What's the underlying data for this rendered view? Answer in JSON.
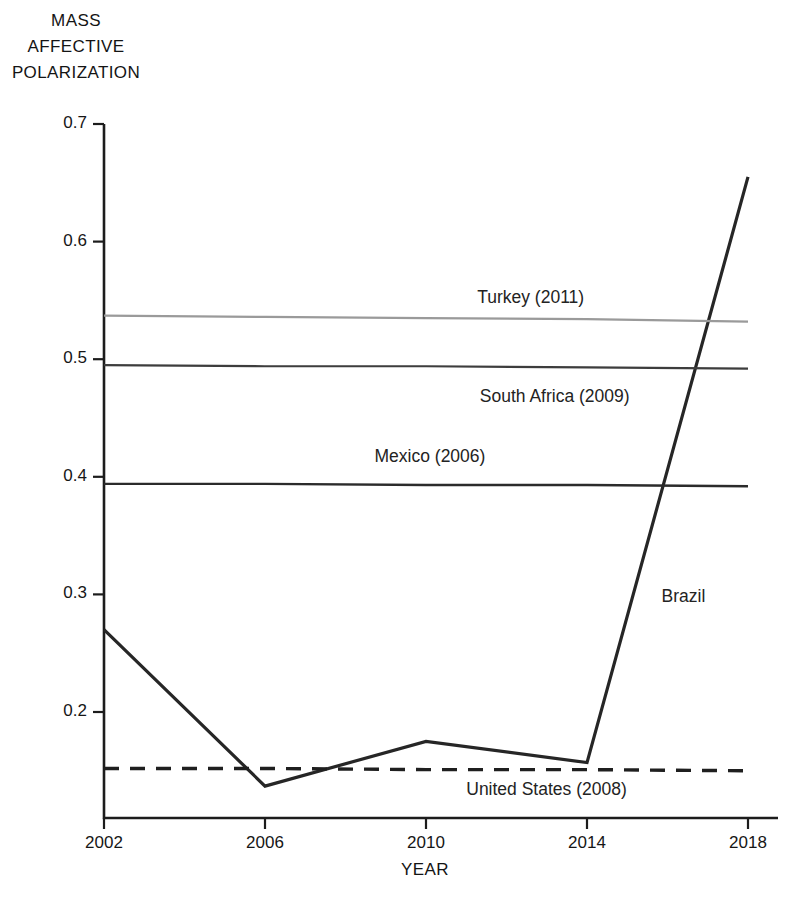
{
  "figure": {
    "background": "#ffffff",
    "axis_title_y_lines": [
      "MASS",
      "AFFECTIVE",
      "POLARIZATION"
    ],
    "axis_title_x": "YEAR"
  },
  "chart_data": {
    "type": "line",
    "title": "",
    "xlabel": "YEAR",
    "ylabel": "MASS AFFECTIVE POLARIZATION",
    "grid": false,
    "legend": "inline-labels",
    "xlim": [
      2002,
      2018
    ],
    "ylim": [
      0.135,
      0.72
    ],
    "x": [
      2002,
      2006,
      2010,
      2014,
      2018
    ],
    "xticks": [
      "2002",
      "2006",
      "2010",
      "2014",
      "2018"
    ],
    "yticks": [
      "0.2",
      "0.3",
      "0.4",
      "0.5",
      "0.6",
      "0.7"
    ],
    "ytick_values": [
      0.2,
      0.3,
      0.4,
      0.5,
      0.6,
      0.7
    ],
    "series": [
      {
        "name": "Brazil",
        "label": "Brazil",
        "style": "solid",
        "color": "#262626",
        "width": 3.2,
        "values": [
          0.27,
          0.137,
          0.175,
          0.157,
          0.655
        ]
      },
      {
        "name": "Turkey (2011)",
        "label": "Turkey (2011)",
        "style": "solid",
        "color": "#9a9a9a",
        "width": 2.2,
        "reference": true,
        "values": [
          0.537,
          0.536,
          0.535,
          0.534,
          0.532
        ]
      },
      {
        "name": "South Africa (2009)",
        "label": "South Africa (2009)",
        "style": "solid",
        "color": "#3d3d3d",
        "width": 2.2,
        "reference": true,
        "values": [
          0.495,
          0.494,
          0.494,
          0.493,
          0.492
        ]
      },
      {
        "name": "Mexico (2006)",
        "label": "Mexico (2006)",
        "style": "solid",
        "color": "#2b2b2b",
        "width": 2.4,
        "reference": true,
        "values": [
          0.394,
          0.394,
          0.393,
          0.393,
          0.392
        ]
      },
      {
        "name": "United States (2008)",
        "label": "United States (2008)",
        "style": "dashed",
        "color": "#1f1f1f",
        "width": 3.4,
        "reference": true,
        "values": [
          0.152,
          0.152,
          0.151,
          0.151,
          0.15
        ]
      }
    ],
    "annotations": [
      {
        "text": "Turkey (2011)",
        "x": 2012.6,
        "y": 0.552
      },
      {
        "text": "South Africa (2009)",
        "x": 2013.2,
        "y": 0.468
      },
      {
        "text": "Mexico (2006)",
        "x": 2010.1,
        "y": 0.417
      },
      {
        "text": "Brazil",
        "x": 2016.4,
        "y": 0.298
      },
      {
        "text": "United States (2008)",
        "x": 2013.0,
        "y": 0.134
      }
    ]
  }
}
